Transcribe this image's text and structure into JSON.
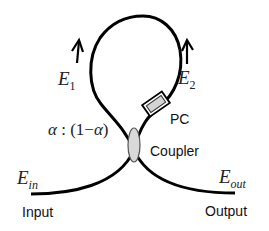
{
  "diagram": {
    "type": "fiber-loop-mirror",
    "colors": {
      "fiber": "#000000",
      "coupler_fill": "#d9d9d9",
      "pc_fill": "#d4d4d4",
      "text": "#111111"
    },
    "labels": {
      "e1_base": "E",
      "e1_sub": "1",
      "e2_base": "E",
      "e2_sub": "2",
      "ein_base": "E",
      "ein_sub": "in",
      "eout_base": "E",
      "eout_sub": "out",
      "ratio_alpha": "α",
      "ratio_rest": " : (1−",
      "ratio_alpha2": "α",
      "ratio_close": ")",
      "pc": "PC",
      "coupler": "Coupler",
      "input": "Input",
      "output": "Output"
    },
    "arrows": [
      {
        "name": "e1-direction",
        "direction": "up"
      },
      {
        "name": "e2-direction",
        "direction": "up"
      }
    ]
  }
}
